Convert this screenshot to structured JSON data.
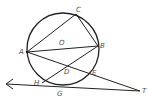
{
  "diagram": {
    "type": "geometry-circle-tangent-secant",
    "stroke_color": "#222222",
    "label_color": "#4a4a4a",
    "circle": {
      "center_label": "O",
      "cx": 63,
      "cy": 49,
      "r": 36
    },
    "points": {
      "A": {
        "label": "A",
        "x": 27,
        "y": 52
      },
      "B": {
        "label": "B",
        "x": 98,
        "y": 46
      },
      "C": {
        "label": "C",
        "x": 76,
        "y": 14
      },
      "D": {
        "label": "D",
        "x": 66,
        "y": 66
      },
      "E": {
        "label": "E",
        "x": 90,
        "y": 73
      },
      "H": {
        "label": "H",
        "x": 42,
        "y": 83
      },
      "G": {
        "label": "G",
        "x": 60,
        "y": 86
      },
      "T": {
        "label": "T",
        "x": 140,
        "y": 91
      },
      "O": {
        "label": "O",
        "x": 63,
        "y": 42
      }
    },
    "segments": [
      {
        "from": "A",
        "to": "C"
      },
      {
        "from": "C",
        "to": "B"
      },
      {
        "from": "A",
        "to": "B"
      },
      {
        "from": "A",
        "to": "T"
      },
      {
        "from": "B",
        "to": "H"
      }
    ],
    "rays": [
      {
        "from": "T",
        "through": "G",
        "arrow_end": {
          "x": 6,
          "y": 84
        }
      }
    ]
  }
}
